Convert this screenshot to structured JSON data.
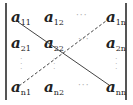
{
  "matrix": {
    "type": "determinant",
    "rows": [
      [
        {
          "base": "a",
          "sub": "11"
        },
        {
          "base": "a",
          "sub": "12"
        },
        {
          "dots": "···"
        },
        {
          "base": "a",
          "sub": "1n"
        }
      ],
      [
        {
          "base": "a",
          "sub": "21"
        },
        {
          "base": "a",
          "sub": "22"
        },
        {
          "dots": "···"
        },
        {
          "base": "a",
          "sub": "2n"
        }
      ],
      [
        {
          "vdots": "⋮"
        },
        {
          "vdots": "⋮"
        },
        {
          "blank": ""
        },
        {
          "vdots": "⋮"
        }
      ],
      [
        {
          "base": "a",
          "sub": "n1"
        },
        {
          "base": "a",
          "sub": "n2"
        },
        {
          "dots": "···"
        },
        {
          "base": "a",
          "sub": "nn"
        }
      ]
    ],
    "labels": {
      "a11": "a",
      "a11_sub": "11",
      "a12": "a",
      "a12_sub": "12",
      "a1n": "a",
      "a1n_sub": "1n",
      "a21": "a",
      "a21_sub": "21",
      "a22": "a",
      "a22_sub": "22",
      "a2n": "a",
      "a2n_sub": "2n",
      "an1": "a",
      "an1_sub": "n1",
      "an2": "a",
      "an2_sub": "n2",
      "ann": "a",
      "ann_sub": "nn",
      "hdots": "···",
      "vdots": "·\n·\n·"
    },
    "diagonals": {
      "main": {
        "style": "solid",
        "from": "a11",
        "to": "ann"
      },
      "anti": {
        "style": "dashed",
        "from": "an1",
        "to": "a1n"
      }
    },
    "colors": {
      "text": "#222222",
      "lines": "#555555",
      "dots": "#aaaaaa"
    }
  }
}
